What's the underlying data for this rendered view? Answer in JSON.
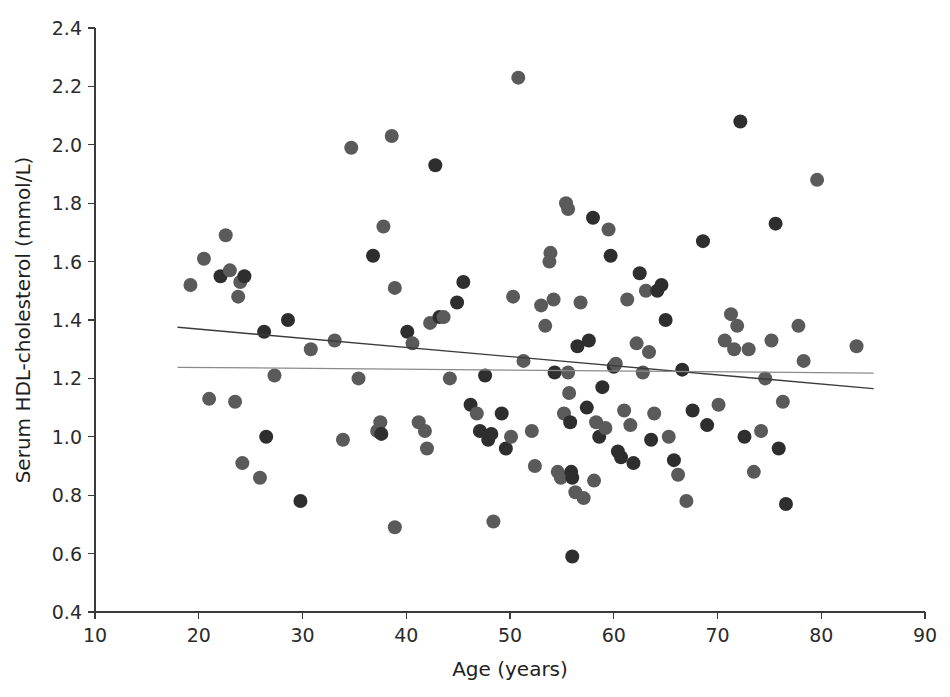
{
  "chart_data": {
    "type": "scatter",
    "title": "",
    "xlabel": "Age (years)",
    "ylabel": "Serum HDL-cholesterol (mmol/L)",
    "xlim": [
      10,
      90
    ],
    "ylim": [
      0.4,
      2.4
    ],
    "xticks": [
      10,
      20,
      30,
      40,
      50,
      60,
      70,
      80,
      90
    ],
    "yticks": [
      0.4,
      0.6,
      0.8,
      1.0,
      1.2,
      1.4,
      1.6,
      1.8,
      2.0,
      2.2,
      2.4
    ],
    "xtick_labels": [
      "10",
      "20",
      "30",
      "40",
      "50",
      "60",
      "70",
      "80",
      "90"
    ],
    "ytick_labels": [
      "0.4",
      "0.6",
      "0.8",
      "1.0",
      "1.2",
      "1.4",
      "1.6",
      "1.8",
      "2.0",
      "2.2",
      "2.4"
    ],
    "grid": false,
    "legend": false,
    "marker": {
      "shape": "circle",
      "radius_px": 7,
      "color_dark": "#2e2e2e",
      "color_mid": "#5a5a5a"
    },
    "series": [
      {
        "name": "Subjects",
        "points": [
          [
            19.2,
            1.52
          ],
          [
            20.5,
            1.61
          ],
          [
            21.0,
            1.13
          ],
          [
            22.1,
            1.55
          ],
          [
            22.6,
            1.69
          ],
          [
            23.0,
            1.57
          ],
          [
            23.5,
            1.12
          ],
          [
            23.8,
            1.48
          ],
          [
            24.0,
            1.53
          ],
          [
            24.2,
            0.91
          ],
          [
            24.4,
            1.55
          ],
          [
            25.9,
            0.86
          ],
          [
            26.3,
            1.36
          ],
          [
            26.5,
            1.0
          ],
          [
            27.3,
            1.21
          ],
          [
            28.6,
            1.4
          ],
          [
            29.8,
            0.78
          ],
          [
            30.8,
            1.3
          ],
          [
            33.1,
            1.33
          ],
          [
            33.9,
            0.99
          ],
          [
            34.7,
            1.99
          ],
          [
            35.4,
            1.2
          ],
          [
            36.8,
            1.62
          ],
          [
            37.2,
            1.02
          ],
          [
            37.5,
            1.05
          ],
          [
            37.6,
            1.01
          ],
          [
            37.8,
            1.72
          ],
          [
            38.6,
            2.03
          ],
          [
            38.9,
            1.51
          ],
          [
            38.9,
            0.69
          ],
          [
            40.1,
            1.36
          ],
          [
            40.6,
            1.32
          ],
          [
            41.2,
            1.05
          ],
          [
            41.8,
            1.02
          ],
          [
            42.0,
            0.96
          ],
          [
            42.3,
            1.39
          ],
          [
            42.8,
            1.93
          ],
          [
            43.2,
            1.41
          ],
          [
            43.6,
            1.41
          ],
          [
            44.2,
            1.2
          ],
          [
            44.9,
            1.46
          ],
          [
            45.5,
            1.53
          ],
          [
            46.2,
            1.11
          ],
          [
            46.8,
            1.08
          ],
          [
            47.1,
            1.02
          ],
          [
            47.6,
            1.21
          ],
          [
            47.9,
            0.99
          ],
          [
            48.2,
            1.01
          ],
          [
            48.4,
            0.71
          ],
          [
            49.2,
            1.08
          ],
          [
            49.6,
            0.96
          ],
          [
            50.1,
            1.0
          ],
          [
            50.3,
            1.48
          ],
          [
            50.8,
            2.23
          ],
          [
            51.3,
            1.26
          ],
          [
            52.1,
            1.02
          ],
          [
            52.4,
            0.9
          ],
          [
            53.0,
            1.45
          ],
          [
            53.4,
            1.38
          ],
          [
            53.8,
            1.6
          ],
          [
            53.9,
            1.63
          ],
          [
            54.2,
            1.47
          ],
          [
            54.3,
            1.22
          ],
          [
            54.6,
            0.88
          ],
          [
            54.9,
            0.86
          ],
          [
            55.2,
            1.08
          ],
          [
            55.4,
            1.8
          ],
          [
            55.6,
            1.78
          ],
          [
            55.6,
            1.22
          ],
          [
            55.7,
            1.15
          ],
          [
            55.8,
            1.05
          ],
          [
            55.9,
            0.88
          ],
          [
            56.0,
            0.86
          ],
          [
            56.0,
            0.59
          ],
          [
            56.3,
            0.81
          ],
          [
            56.5,
            1.31
          ],
          [
            56.8,
            1.46
          ],
          [
            57.1,
            0.79
          ],
          [
            57.4,
            1.1
          ],
          [
            57.6,
            1.33
          ],
          [
            58.0,
            1.75
          ],
          [
            58.1,
            0.85
          ],
          [
            58.3,
            1.05
          ],
          [
            58.6,
            1.0
          ],
          [
            58.9,
            1.17
          ],
          [
            59.2,
            1.03
          ],
          [
            59.5,
            1.71
          ],
          [
            59.7,
            1.62
          ],
          [
            60.0,
            1.24
          ],
          [
            60.2,
            1.25
          ],
          [
            60.4,
            0.95
          ],
          [
            60.7,
            0.93
          ],
          [
            61.0,
            1.09
          ],
          [
            61.3,
            1.47
          ],
          [
            61.6,
            1.04
          ],
          [
            61.9,
            0.91
          ],
          [
            62.2,
            1.32
          ],
          [
            62.5,
            1.56
          ],
          [
            62.8,
            1.22
          ],
          [
            63.1,
            1.5
          ],
          [
            63.4,
            1.29
          ],
          [
            63.6,
            0.99
          ],
          [
            63.9,
            1.08
          ],
          [
            64.2,
            1.5
          ],
          [
            64.6,
            1.52
          ],
          [
            65.0,
            1.4
          ],
          [
            65.3,
            1.0
          ],
          [
            65.8,
            0.92
          ],
          [
            66.2,
            0.87
          ],
          [
            66.6,
            1.23
          ],
          [
            67.0,
            0.78
          ],
          [
            67.6,
            1.09
          ],
          [
            68.6,
            1.67
          ],
          [
            69.0,
            1.04
          ],
          [
            70.1,
            1.11
          ],
          [
            70.7,
            1.33
          ],
          [
            71.3,
            1.42
          ],
          [
            71.6,
            1.3
          ],
          [
            71.9,
            1.38
          ],
          [
            72.2,
            2.08
          ],
          [
            72.6,
            1.0
          ],
          [
            73.0,
            1.3
          ],
          [
            73.5,
            0.88
          ],
          [
            74.2,
            1.02
          ],
          [
            74.6,
            1.2
          ],
          [
            75.2,
            1.33
          ],
          [
            75.6,
            1.73
          ],
          [
            75.9,
            0.96
          ],
          [
            76.3,
            1.12
          ],
          [
            76.6,
            0.77
          ],
          [
            77.8,
            1.38
          ],
          [
            78.3,
            1.26
          ],
          [
            79.6,
            1.88
          ],
          [
            83.4,
            1.31
          ]
        ]
      }
    ],
    "fit_lines": [
      {
        "name": "regression-line-dark",
        "color": "#3b3b3b",
        "width_px": 1.4,
        "x_start": 18.0,
        "y_start": 1.375,
        "x_end": 85.0,
        "y_end": 1.165
      },
      {
        "name": "regression-line-light",
        "color": "#8a8a8a",
        "width_px": 1.2,
        "x_start": 18.0,
        "y_start": 1.238,
        "x_end": 85.0,
        "y_end": 1.218
      }
    ]
  }
}
